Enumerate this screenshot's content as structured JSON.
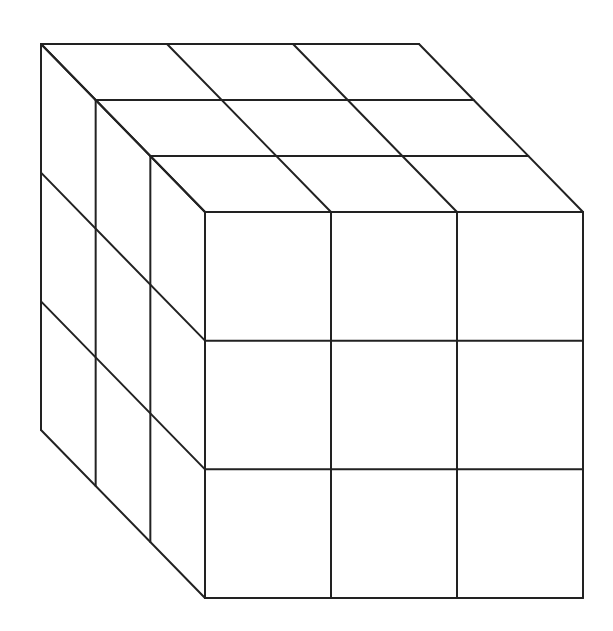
{
  "diagram": {
    "type": "oblique-cube-grid",
    "grid_size": 3,
    "stroke_color": "#222222",
    "background": "#ffffff",
    "front_face": {
      "x0": 205,
      "y0": 212,
      "x1": 583,
      "y1": 598
    },
    "depth_offset": {
      "dx": -164,
      "dy": -168
    }
  }
}
